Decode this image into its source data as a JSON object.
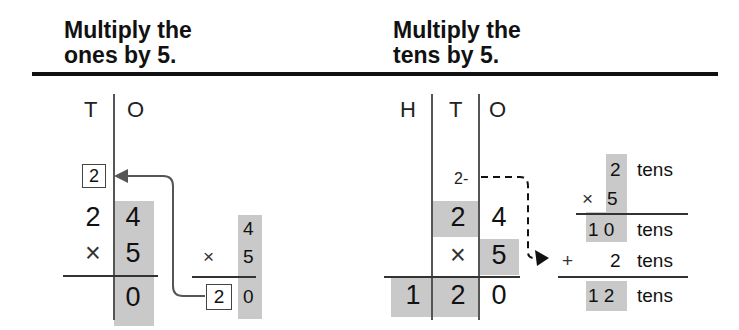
{
  "left_panel": {
    "heading_line1": "Multiply the",
    "heading_line2": "ones by 5.",
    "columns": [
      "T",
      "O"
    ],
    "carry_boxed": "2",
    "multiplicand": {
      "tens": "2",
      "ones": "4"
    },
    "multiplier": {
      "sign": "×",
      "ones": "5"
    },
    "result": {
      "ones": "0"
    },
    "side_calc": {
      "top": "4",
      "sign": "×",
      "mult": "5",
      "result_carry_boxed": "2",
      "result_ones": "0"
    }
  },
  "right_panel": {
    "heading_line1": "Multiply the",
    "heading_line2": "tens by 5.",
    "columns": [
      "H",
      "T",
      "O"
    ],
    "carry": "2-",
    "multiplicand": {
      "tens": "2",
      "ones": "4"
    },
    "multiplier": {
      "sign": "×",
      "ones": "5"
    },
    "result": {
      "hundreds": "1",
      "tens": "2",
      "ones": "0"
    },
    "side_calc": {
      "row1_num": "2",
      "row1_unit": "tens",
      "row2_sign": "×",
      "row2_num": "5",
      "row3_num": "1 0",
      "row3_unit": "tens",
      "row4_sign": "+",
      "row4_num": "2",
      "row4_unit": "tens",
      "row5_num": "1 2",
      "row5_unit": "tens"
    }
  },
  "colors": {
    "highlight": "#c9c9c9",
    "rule": "#111111",
    "arrow": "#555555"
  }
}
